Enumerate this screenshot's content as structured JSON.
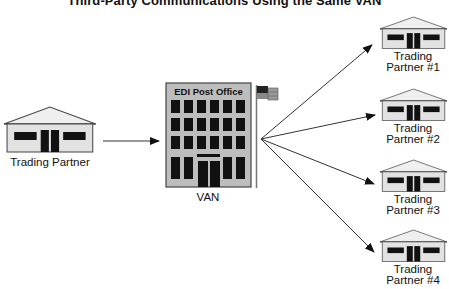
{
  "title": "Third-Party Communications Using the Same VAN",
  "colors": {
    "house_fill": "#e2e2e2",
    "building_fill": "#bdbdbd",
    "outline": "#444444",
    "window": "#111111",
    "line": "#333333"
  },
  "source": {
    "label": "Trading Partner",
    "icon": "house-icon"
  },
  "van": {
    "building_sign": "EDI Post Office",
    "label": "VAN",
    "icon": "office-building-icon",
    "flag_icon": "flag-icon"
  },
  "partners": [
    {
      "line1": "Trading",
      "line2": "Partner #1"
    },
    {
      "line1": "Trading",
      "line2": "Partner #2"
    },
    {
      "line1": "Trading",
      "line2": "Partner #3"
    },
    {
      "line1": "Trading",
      "line2": "Partner #4"
    }
  ],
  "connections": [
    {
      "from": "Trading Partner",
      "to": "VAN"
    },
    {
      "from": "VAN",
      "to": "Trading Partner #1"
    },
    {
      "from": "VAN",
      "to": "Trading Partner #2"
    },
    {
      "from": "VAN",
      "to": "Trading Partner #3"
    },
    {
      "from": "VAN",
      "to": "Trading Partner #4"
    }
  ]
}
